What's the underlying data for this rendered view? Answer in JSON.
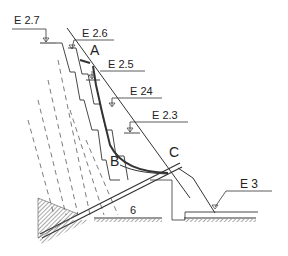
{
  "diagram": {
    "type": "engineering cross-section (stepped slope / dam profile)",
    "elevation_labels": [
      {
        "id": "e27",
        "text": "E 2.7"
      },
      {
        "id": "e26",
        "text": "E 2.6"
      },
      {
        "id": "e25",
        "text": "E 2.5"
      },
      {
        "id": "e24",
        "text": "E 24"
      },
      {
        "id": "e23",
        "text": "E 2.3"
      },
      {
        "id": "e3",
        "text": "E 3"
      }
    ],
    "point_labels": {
      "a": "A",
      "b": "B",
      "c": "C"
    },
    "section_number": "6",
    "colors": {
      "line": "#333333",
      "background": "#ffffff",
      "hatch": "#555555"
    }
  }
}
